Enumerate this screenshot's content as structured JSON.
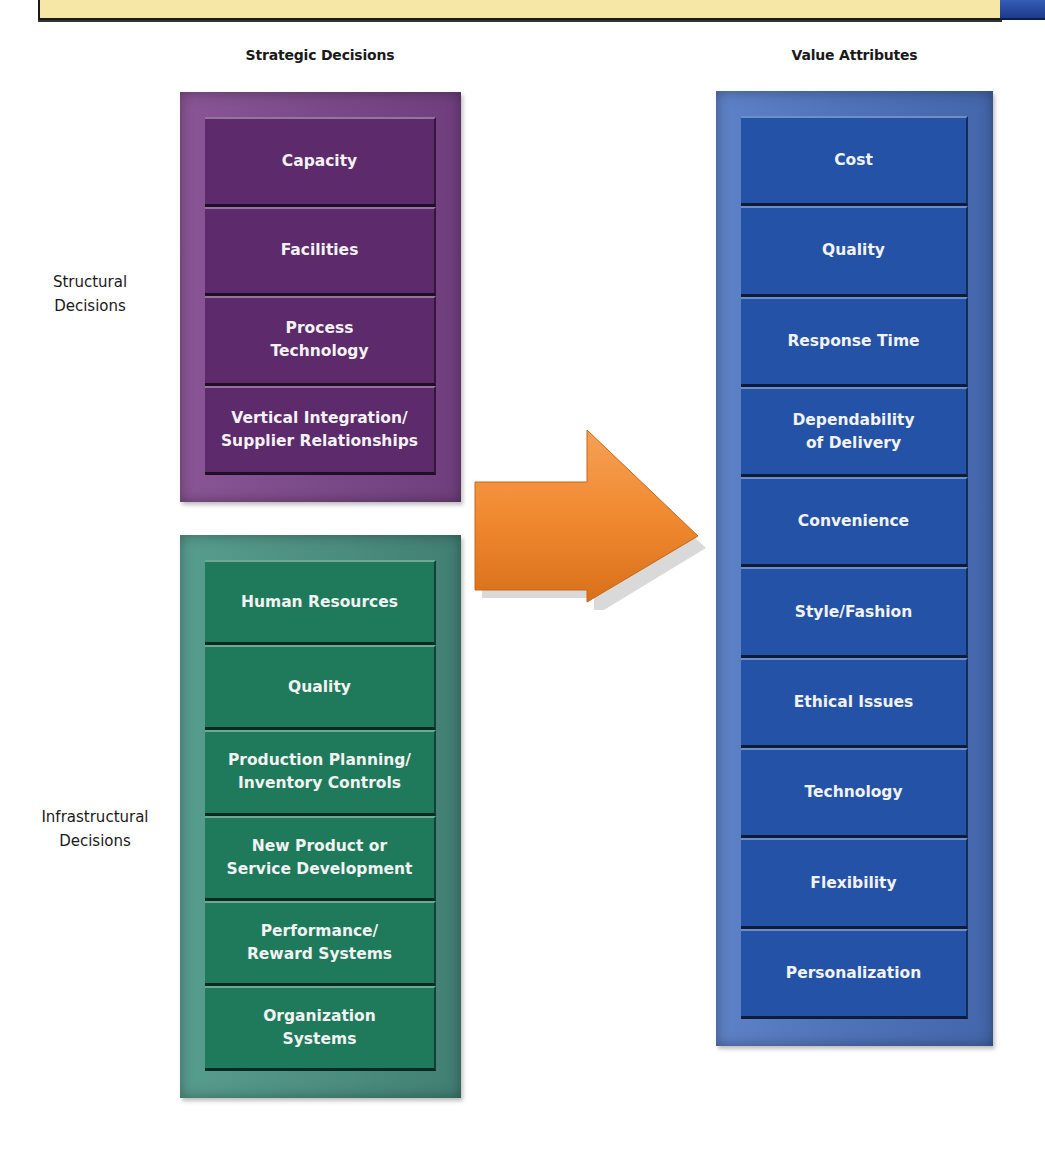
{
  "banner": {
    "title": ""
  },
  "headings": {
    "left": "Strategic Decisions",
    "right": "Value Attributes"
  },
  "side_labels": {
    "structural": "Structural\nDecisions",
    "infrastructural": "Infrastructural\nDecisions"
  },
  "structural_decisions": [
    "Capacity",
    "Facilities",
    "Process\nTechnology",
    "Vertical Integration/\nSupplier Relationships"
  ],
  "infrastructural_decisions": [
    "Human Resources",
    "Quality",
    "Production Planning/\nInventory Controls",
    "New Product or\nService Development",
    "Performance/\nReward Systems",
    "Organization\nSystems"
  ],
  "value_attributes": [
    "Cost",
    "Quality",
    "Response Time",
    "Dependability\nof Delivery",
    "Convenience",
    "Style/Fashion",
    "Ethical Issues",
    "Technology",
    "Flexibility",
    "Personalization"
  ],
  "colors": {
    "structural": "#5d2a6b",
    "infrastructural": "#1f7a5c",
    "value": "#2352a6",
    "arrow": "#f08a30",
    "banner": "#f7e7a6"
  },
  "arrow": {
    "icon": "right-arrow-icon",
    "meaning": "decisions lead to value attributes"
  }
}
